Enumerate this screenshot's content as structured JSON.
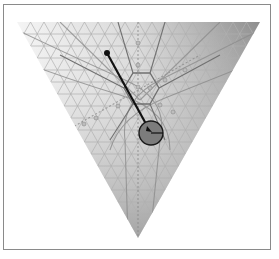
{
  "diagram": {
    "type": "ternary-simplex",
    "triangle": {
      "vertices": [
        [
          17,
          22
        ],
        [
          260,
          22
        ],
        [
          138,
          238
        ]
      ]
    },
    "gradient": {
      "left": "#f2f2f2",
      "right": "#9a9a9a",
      "bottom": "#a8a8a8"
    },
    "grid": {
      "divisions": 18,
      "color": "#b4b4b4"
    },
    "hexagon": {
      "center": [
        141,
        90
      ],
      "radius": 17,
      "color": "#6e6e6e"
    },
    "pointer": {
      "start": [
        107,
        53
      ],
      "end": [
        151,
        133
      ],
      "tip_dot_radius": 3,
      "color": "#111111"
    },
    "dial": {
      "center": [
        151,
        133
      ],
      "radius": 12,
      "fill": "#7c7c7c",
      "stroke": "#1a1a1a"
    },
    "markers": [
      [
        138,
        43
      ],
      [
        138,
        65
      ],
      [
        138,
        87
      ],
      [
        150,
        88
      ],
      [
        165,
        80
      ],
      [
        185,
        70
      ],
      [
        118,
        106
      ],
      [
        96,
        118
      ],
      [
        84,
        124
      ],
      [
        160,
        105
      ],
      [
        173,
        112
      ]
    ],
    "colors": {
      "frame": "#8a8a8a",
      "background": "#ffffff"
    }
  }
}
